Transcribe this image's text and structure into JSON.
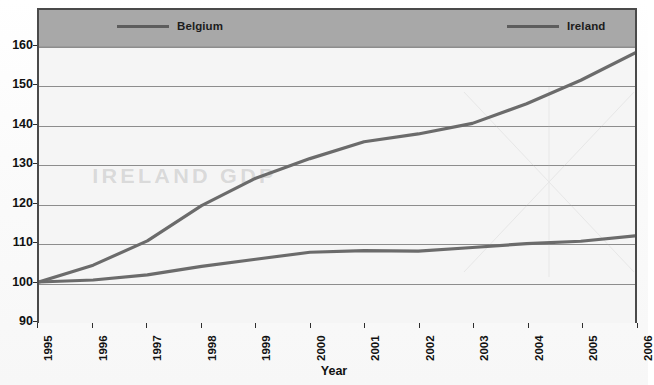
{
  "legend": {
    "entries": [
      {
        "label": "Belgium",
        "color": "#5d5d5d",
        "swatch_name": "legend-line-belgium"
      },
      {
        "label": "Ireland",
        "color": "#5d5d5d",
        "swatch_name": "legend-line-ireland"
      }
    ]
  },
  "axes": {
    "x_title": "Year",
    "y_tick_labels": [
      "160",
      "150",
      "140",
      "130",
      "120",
      "110",
      "100",
      "90"
    ],
    "x_tick_labels": [
      "1995",
      "1996",
      "1997",
      "1998",
      "1999",
      "2000",
      "2001",
      "2002",
      "2003",
      "2004",
      "2005",
      "2006"
    ]
  },
  "artifact": {
    "bleed_through_text": "IRELAND GDP"
  },
  "colors": {
    "frame": "#4a4a4a",
    "legend_band": "#a8a8a8",
    "plot_background": "#f5f5f5",
    "gridline": "#8d8d8d",
    "series_line": "#6b6b6b",
    "text": "#111111"
  },
  "chart_data": {
    "type": "line",
    "title": "",
    "xlabel": "Year",
    "ylabel": "",
    "x": [
      1995,
      1996,
      1997,
      1998,
      1999,
      2000,
      2001,
      2002,
      2003,
      2004,
      2005,
      2006
    ],
    "xlim": [
      1995,
      2006
    ],
    "ylim": [
      90,
      160
    ],
    "y_ticks": [
      90,
      100,
      110,
      120,
      130,
      140,
      150,
      160
    ],
    "grid": true,
    "legend_position": "top",
    "series": [
      {
        "name": "Belgium",
        "color": "#6b6b6b",
        "values": [
          100.0,
          100.5,
          101.8,
          104.0,
          105.8,
          107.6,
          108.0,
          107.9,
          108.8,
          109.8,
          110.4,
          111.8
        ]
      },
      {
        "name": "Ireland",
        "color": "#6b6b6b",
        "values": [
          100.0,
          104.3,
          110.5,
          119.5,
          126.5,
          131.5,
          135.8,
          137.8,
          140.5,
          145.5,
          151.5,
          158.5
        ]
      }
    ]
  }
}
